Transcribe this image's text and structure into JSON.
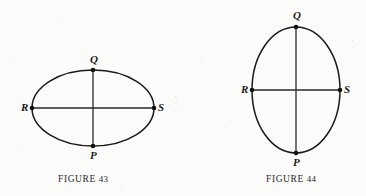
{
  "page": {
    "background_color": "#fbfbfa",
    "ink_color": "#1a1a1a",
    "width": 366,
    "height": 196
  },
  "figures": [
    {
      "id": "figure-43",
      "caption_lead": "Figure",
      "caption_number": "43",
      "caption_text": "Figure 43",
      "shape": "ellipse",
      "orientation": "horizontal",
      "center": {
        "x": 93,
        "y": 108
      },
      "radius_x": 61,
      "radius_y": 38,
      "vertices": [
        {
          "name": "Q",
          "label": "Q",
          "position": "top",
          "x": 93,
          "y": 70,
          "label_x": 90,
          "label_y": 54
        },
        {
          "name": "P",
          "label": "P",
          "position": "bottom",
          "x": 93,
          "y": 146,
          "label_x": 90,
          "label_y": 150
        },
        {
          "name": "R",
          "label": "R",
          "position": "left",
          "x": 32,
          "y": 108,
          "label_x": 21,
          "label_y": 102
        },
        {
          "name": "S",
          "label": "S",
          "position": "right",
          "x": 154,
          "y": 108,
          "label_x": 158,
          "label_y": 102
        }
      ],
      "axes": [
        {
          "name": "major-axis",
          "from": "R",
          "to": "S"
        },
        {
          "name": "minor-axis",
          "from": "Q",
          "to": "P"
        }
      ],
      "caption_x": 58,
      "caption_y": 174
    },
    {
      "id": "figure-44",
      "caption_lead": "Figure",
      "caption_number": "44",
      "caption_text": "Figure 44",
      "shape": "ellipse",
      "orientation": "vertical",
      "center": {
        "x": 296,
        "y": 90
      },
      "radius_x": 44,
      "radius_y": 63,
      "vertices": [
        {
          "name": "Q",
          "label": "Q",
          "position": "top",
          "x": 296,
          "y": 27,
          "label_x": 293,
          "label_y": 10
        },
        {
          "name": "P",
          "label": "P",
          "position": "bottom",
          "x": 296,
          "y": 153,
          "label_x": 293,
          "label_y": 157
        },
        {
          "name": "R",
          "label": "R",
          "position": "left",
          "x": 252,
          "y": 90,
          "label_x": 241,
          "label_y": 84
        },
        {
          "name": "S",
          "label": "S",
          "position": "right",
          "x": 340,
          "y": 90,
          "label_x": 344,
          "label_y": 84
        }
      ],
      "axes": [
        {
          "name": "major-axis",
          "from": "Q",
          "to": "P"
        },
        {
          "name": "minor-axis",
          "from": "R",
          "to": "S"
        }
      ],
      "caption_x": 266,
      "caption_y": 174
    }
  ]
}
